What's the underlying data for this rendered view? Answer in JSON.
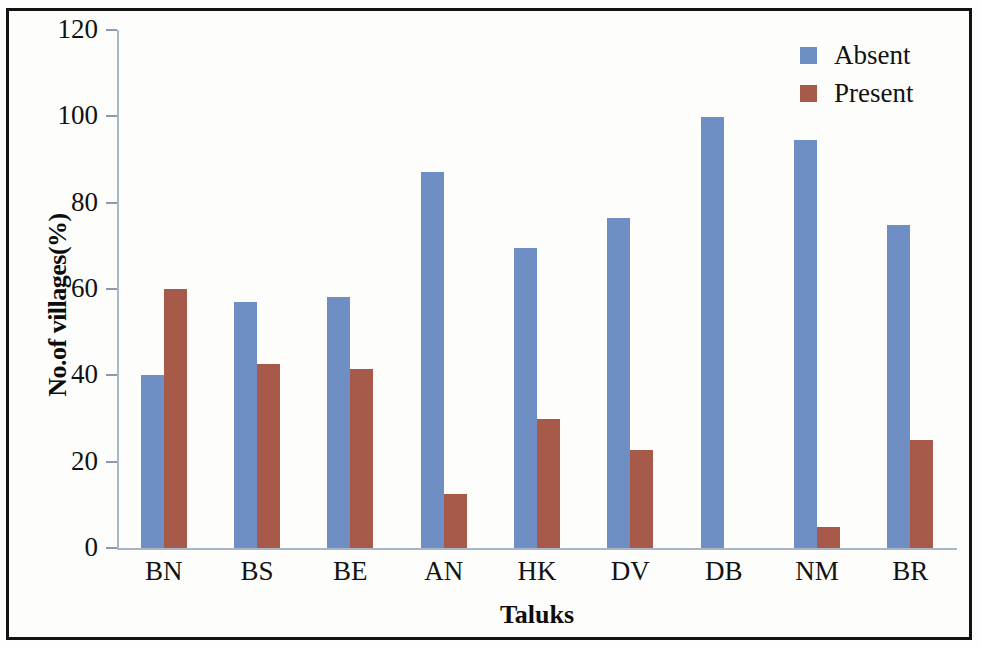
{
  "chart_data": {
    "type": "bar",
    "title": "",
    "xlabel": "Taluks",
    "ylabel": "No.of villages(%)",
    "categories": [
      "BN",
      "BS",
      "BE",
      "AN",
      "HK",
      "DV",
      "DB",
      "NM",
      "BR"
    ],
    "series": [
      {
        "name": "Absent",
        "color": "#6f8fc4",
        "values": [
          40,
          57,
          58.2,
          87,
          69.5,
          76.5,
          99.8,
          94.5,
          74.8
        ]
      },
      {
        "name": "Present",
        "color": "#a75a49",
        "values": [
          60,
          42.7,
          41.4,
          12.5,
          30,
          22.7,
          0,
          4.8,
          25.1
        ]
      }
    ],
    "ylim": [
      0,
      120
    ],
    "yticks": [
      0,
      20,
      40,
      60,
      80,
      100,
      120
    ],
    "ytick_labels": [
      "0",
      "20",
      "40",
      "60",
      "80",
      "100",
      "120"
    ],
    "grid": false,
    "legend_position": "top-right"
  },
  "legend": {
    "entries": [
      {
        "label": "Absent",
        "color": "#6f8fc4"
      },
      {
        "label": "Present",
        "color": "#a75a49"
      }
    ]
  },
  "colors": {
    "absent": "#6f8fc4",
    "present": "#a75a49",
    "axis": "#a9b6c6",
    "text": "#121212",
    "frame": "#15120f"
  }
}
